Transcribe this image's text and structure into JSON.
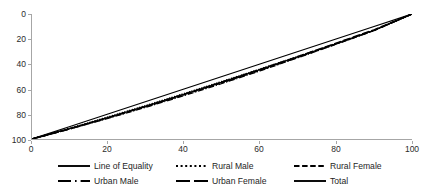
{
  "chart_data": {
    "type": "line",
    "title": "",
    "subtitle": "",
    "xlabel": "",
    "ylabel": "",
    "xlim": [
      0,
      100
    ],
    "ylim": [
      0,
      100
    ],
    "grid": false,
    "legend_position": "bottom",
    "xticks": [
      "0",
      "20",
      "40",
      "60",
      "80",
      "100"
    ],
    "yticks": [
      "0",
      "20",
      "40",
      "60",
      "80",
      "100"
    ],
    "x": [
      0,
      10,
      20,
      30,
      40,
      50,
      60,
      70,
      80,
      90,
      100
    ],
    "series": [
      {
        "name": "Line of Equality",
        "style": "solid",
        "color": "#000000",
        "values": [
          0,
          10,
          20,
          30,
          40,
          50,
          60,
          70,
          80,
          90,
          100
        ]
      },
      {
        "name": "Rural Male",
        "style": "dotted",
        "color": "#000000",
        "values": [
          0,
          8.6,
          17.6,
          26.8,
          36.3,
          46.0,
          55.9,
          66.0,
          76.3,
          87.0,
          100
        ]
      },
      {
        "name": "Rural Female",
        "style": "dashed",
        "color": "#000000",
        "values": [
          0,
          8.2,
          16.9,
          25.9,
          35.3,
          45.0,
          55.0,
          65.4,
          76.0,
          86.8,
          100
        ]
      },
      {
        "name": "Urban Male",
        "style": "dash-dot",
        "color": "#000000",
        "values": [
          0,
          8.0,
          16.5,
          25.4,
          34.7,
          44.4,
          54.5,
          65.0,
          75.8,
          86.7,
          100
        ]
      },
      {
        "name": "Urban Female",
        "style": "long-dash",
        "color": "#000000",
        "values": [
          0,
          8.3,
          17.1,
          26.2,
          35.7,
          45.5,
          55.6,
          66.0,
          76.6,
          87.3,
          100
        ]
      },
      {
        "name": "Total",
        "style": "solid",
        "color": "#000000",
        "values": [
          0,
          8.4,
          17.2,
          26.3,
          35.8,
          45.5,
          55.5,
          65.8,
          76.2,
          87.0,
          100
        ]
      }
    ]
  },
  "legend": {
    "row1": [
      {
        "label": "Line of Equality",
        "style": "solid"
      },
      {
        "label": "Rural Male",
        "style": "dotted"
      },
      {
        "label": "Rural Female",
        "style": "dashed"
      }
    ],
    "row2": [
      {
        "label": "Urban Male",
        "style": "dash-dot"
      },
      {
        "label": "Urban Female",
        "style": "long-dash"
      },
      {
        "label": "Total",
        "style": "solid"
      }
    ]
  },
  "axes": {
    "x_tick_labels": [
      "0",
      "20",
      "40",
      "60",
      "80",
      "100"
    ],
    "y_tick_labels": [
      "0",
      "20",
      "40",
      "60",
      "80",
      "100"
    ],
    "axis_color": "#a6a6a6"
  }
}
